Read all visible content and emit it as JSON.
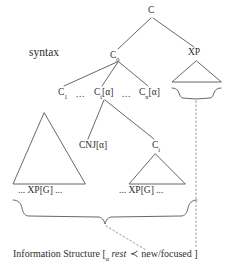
{
  "figure": {
    "type": "syntax-tree-diagram",
    "level_labels": {
      "syntax": "syntax",
      "information_structure": "Information Structure"
    },
    "ink_color": "#2e2e2e",
    "background_color": "#ffffff"
  },
  "tree": {
    "root": {
      "label": "C"
    },
    "nodes": [
      {
        "id": "c-top",
        "label": "C",
        "sub": ""
      },
      {
        "id": "c0",
        "label": "C",
        "sub": "0"
      },
      {
        "id": "xp",
        "label": "XP",
        "sub": ""
      },
      {
        "id": "c1",
        "label": "C",
        "sub": "1"
      },
      {
        "id": "ci-a",
        "label": "C",
        "sub": "i",
        "bracket": "[α]"
      },
      {
        "id": "cn-a",
        "label": "C",
        "sub": "n",
        "bracket": "[α]"
      },
      {
        "id": "cnj",
        "label": "CNJ",
        "sub": "",
        "bracket": "[α]"
      },
      {
        "id": "ci",
        "label": "C",
        "sub": "i"
      }
    ],
    "ellipses": {
      "between_c1_and_ci": "...",
      "between_ci_and_cn": "..."
    },
    "leaves": [
      {
        "id": "xpg-left",
        "text": "... XP[G] ..."
      },
      {
        "id": "xpg-right",
        "text": "... XP[G] ..."
      }
    ]
  },
  "information_structure": {
    "label": "Information Structure",
    "open_bracket": "[",
    "bracket_subscript": "α",
    "rest": "rest",
    "precedence_operator": "≺",
    "new_focused": "new/focused",
    "close_bracket": "]"
  }
}
